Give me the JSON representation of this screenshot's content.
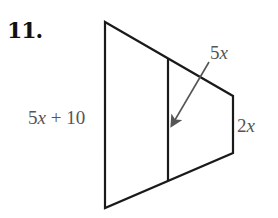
{
  "problem": {
    "number": "11."
  },
  "figure": {
    "type": "trapezoid-midsegment",
    "labels": {
      "left_base": {
        "coef": "5",
        "var": "x",
        "rest": " + 10"
      },
      "midsegment": {
        "coef": "5",
        "var": "x"
      },
      "right_base": {
        "coef": "2",
        "var": "x"
      }
    },
    "colors": {
      "stroke": "#1a1a1a",
      "label": "#555555",
      "arrow": "#555555"
    }
  }
}
